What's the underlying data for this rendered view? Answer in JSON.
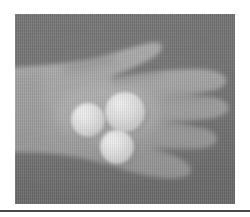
{
  "page": {
    "background_color": "#ffffff",
    "width": 250,
    "height": 217
  },
  "figure": {
    "name": "hand-holding-three-spheres",
    "caption": "",
    "media_type": "grayscale-photograph",
    "frame": {
      "x": 15,
      "y": 14,
      "width": 220,
      "height": 190
    },
    "colors": {
      "background_gray": "#6f6f6f",
      "background_gray_dark": "#676767",
      "hand_gray": "#9d9d9d",
      "hand_gray_light": "#aaaaaa",
      "hand_gray_shadow": "#8d8d8d",
      "sphere_white": "#dcdcdc",
      "sphere_highlight": "#ebebeb",
      "sphere_shadow": "#b9b9b9",
      "rule_color": "#4a4a4a"
    },
    "subject": {
      "label": "open right hand, palm upward, fingers spread toward the right",
      "wrist_label": "forearm entering from the left edge",
      "fingers": [
        {
          "name": "index-finger",
          "direction": "upper-right"
        },
        {
          "name": "middle-finger",
          "direction": "right"
        },
        {
          "name": "ring-finger",
          "direction": "right"
        },
        {
          "name": "little-finger",
          "direction": "lower-right"
        },
        {
          "name": "thumb",
          "direction": "lower-left along the palm"
        }
      ]
    },
    "spheres": [
      {
        "name": "sphere-left",
        "cx": 88,
        "cy": 120,
        "r": 17
      },
      {
        "name": "sphere-top",
        "cx": 125,
        "cy": 112,
        "r": 20
      },
      {
        "name": "sphere-bottom",
        "cx": 117,
        "cy": 147,
        "r": 17
      }
    ]
  },
  "rule": {
    "name": "bottom-horizontal-rule",
    "y": 210,
    "thickness": 2
  }
}
